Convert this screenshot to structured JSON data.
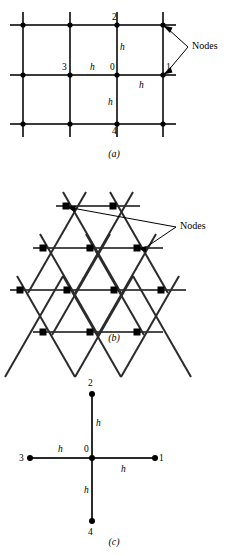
{
  "figure": {
    "panels": [
      {
        "id": "a",
        "caption": "(a)",
        "type": "rectangular-grid",
        "annotation_label": "Nodes",
        "node_labels": [
          "0",
          "1",
          "2",
          "3",
          "4"
        ],
        "spacing_label": "h",
        "spacing_labels": [
          "h",
          "h",
          "h",
          "h"
        ],
        "grid": {
          "columns": 4,
          "rows": 3,
          "x_positions": [
            23,
            70,
            117,
            163
          ],
          "y_positions": [
            25,
            75,
            124
          ]
        },
        "labels": {
          "center_node": "0",
          "east_node": "1",
          "north_node": "2",
          "west_node": "3",
          "south_node": "4"
        }
      },
      {
        "id": "b",
        "caption": "(b)",
        "type": "triangular-grid",
        "annotation_label": "Nodes",
        "rows": [
          2,
          3,
          4,
          3
        ]
      },
      {
        "id": "c",
        "caption": "(c)",
        "type": "five-point-stencil",
        "node_labels": [
          "0",
          "1",
          "2",
          "3",
          "4"
        ],
        "spacing_labels": [
          "h",
          "h",
          "h",
          "h"
        ],
        "labels": {
          "center_node": "0",
          "east_node": "1",
          "north_node": "2",
          "west_node": "3",
          "south_node": "4",
          "north_spacing": "h",
          "west_spacing": "h",
          "east_spacing": "h",
          "south_spacing": "h"
        }
      }
    ]
  },
  "style": {
    "line_color": "#2b2b2b",
    "node_color": "#000000",
    "background": "#ffffff"
  }
}
